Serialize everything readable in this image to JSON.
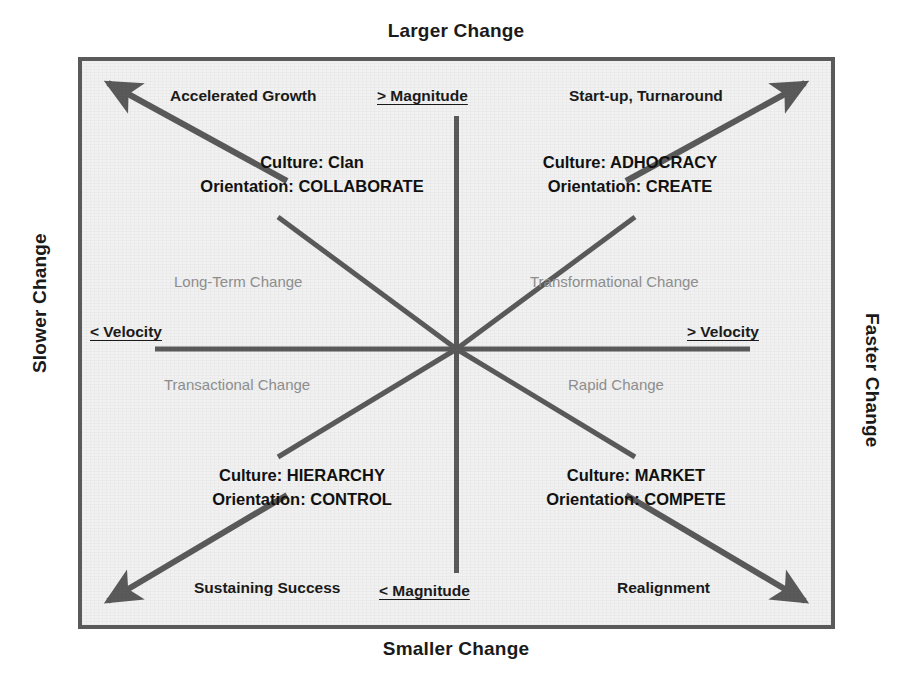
{
  "colors": {
    "frame": "#5a5a5a",
    "spoke": "#5a5a5a",
    "panel_background": "#f1f1f1",
    "text": "#1a1a1a",
    "muted_text": "#8d8d8d"
  },
  "axes": {
    "top_caption": "Larger Change",
    "bottom_caption": "Smaller Change",
    "left_caption": "Slower Change",
    "right_caption": "Faster Change",
    "magnitude_high": "> Magnitude",
    "magnitude_low": "< Magnitude",
    "velocity_low": "< Velocity",
    "velocity_high": "> Velocity"
  },
  "corner_scenarios": {
    "top_left": "Accelerated Growth",
    "top_right": "Start-up, Turnaround",
    "bottom_left": "Sustaining Success",
    "bottom_right": "Realignment"
  },
  "quadrants": [
    {
      "position": "top-left",
      "culture_line": "Culture: Clan",
      "orientation_line": "Orientation: COLLABORATE",
      "culture": "Clan",
      "orientation": "COLLABORATE",
      "change_type": "Long-Term Change",
      "scenario": "Accelerated Growth"
    },
    {
      "position": "top-right",
      "culture_line": "Culture: ADHOCRACY",
      "orientation_line": "Orientation: CREATE",
      "culture": "ADHOCRACY",
      "orientation": "CREATE",
      "change_type": "Transformational Change",
      "scenario": "Start-up, Turnaround"
    },
    {
      "position": "bottom-left",
      "culture_line": "Culture: HIERARCHY",
      "orientation_line": "Orientation: CONTROL",
      "culture": "HIERARCHY",
      "orientation": "CONTROL",
      "change_type": "Transactional Change",
      "scenario": "Sustaining Success"
    },
    {
      "position": "bottom-right",
      "culture_line": "Culture: MARKET",
      "orientation_line": "Orientation: COMPETE",
      "culture": "MARKET",
      "orientation": "COMPETE",
      "change_type": "Rapid Change",
      "scenario": "Realignment"
    }
  ],
  "change_types": {
    "upper_left": "Long-Term Change",
    "upper_right": "Transformational Change",
    "lower_left": "Transactional Change",
    "lower_right": "Rapid Change"
  }
}
